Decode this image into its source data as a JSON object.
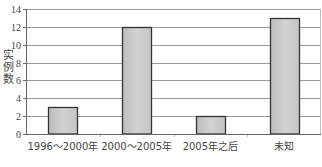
{
  "chart_data": {
    "type": "bar",
    "title": "",
    "xlabel": "",
    "ylabel": "实例数",
    "categories": [
      "1996～2000年",
      "2000～2005年",
      "2005年之后",
      "未知"
    ],
    "values": [
      3,
      12,
      2,
      13
    ],
    "ylim": [
      0,
      14
    ],
    "yticks": [
      0,
      2,
      4,
      6,
      8,
      10,
      12,
      14
    ],
    "grid": true,
    "legend": null,
    "colors": {
      "bar_fill": "#c8c8c8",
      "bar_edge": "#333333",
      "grid": "#999999",
      "axis": "#666666"
    }
  }
}
